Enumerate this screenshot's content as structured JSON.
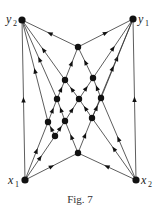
{
  "figure": {
    "caption": "Fig. 7",
    "labels": {
      "y2": {
        "main": "y",
        "sub": "2"
      },
      "y1": {
        "main": "y",
        "sub": "1"
      },
      "x1": {
        "main": "x",
        "sub": "1"
      },
      "x2": {
        "main": "x",
        "sub": "2"
      }
    },
    "nodes": [
      "y2",
      "y1",
      "x1",
      "x2",
      "a",
      "b",
      "c",
      "d",
      "e",
      "f",
      "g",
      "h",
      "i",
      "j",
      "k"
    ],
    "edges": [
      [
        "a",
        "y2"
      ],
      [
        "a",
        "y1"
      ],
      [
        "b",
        "a"
      ],
      [
        "c",
        "a"
      ],
      [
        "b",
        "y2"
      ],
      [
        "c",
        "y1"
      ],
      [
        "d",
        "y2"
      ],
      [
        "f",
        "y1"
      ],
      [
        "g",
        "y2"
      ],
      [
        "i",
        "y1"
      ],
      [
        "x1",
        "y2"
      ],
      [
        "x2",
        "y1"
      ],
      [
        "d",
        "b"
      ],
      [
        "e",
        "b"
      ],
      [
        "e",
        "c"
      ],
      [
        "f",
        "c"
      ],
      [
        "g",
        "d"
      ],
      [
        "h",
        "d"
      ],
      [
        "h",
        "e"
      ],
      [
        "i",
        "e"
      ],
      [
        "i",
        "f"
      ],
      [
        "j",
        "g"
      ],
      [
        "j",
        "h"
      ],
      [
        "k",
        "h"
      ],
      [
        "k",
        "i"
      ],
      [
        "x1",
        "g"
      ],
      [
        "x1",
        "j"
      ],
      [
        "x1",
        "k"
      ],
      [
        "x2",
        "k"
      ],
      [
        "x2",
        "i"
      ],
      [
        "x2",
        "f"
      ]
    ]
  }
}
